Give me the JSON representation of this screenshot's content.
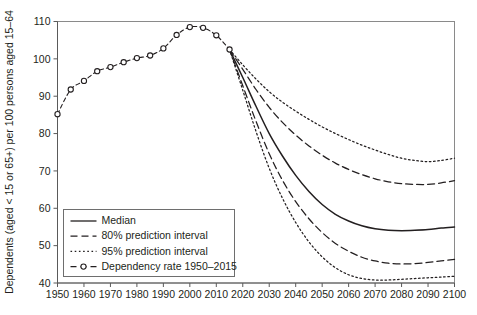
{
  "chart_data": {
    "type": "line",
    "title": "",
    "xlabel": "",
    "ylabel": "Dependents (aged < 15 or 65+) per 100 persons aged 15–64",
    "xlim": [
      1950,
      2100
    ],
    "ylim": [
      40,
      110
    ],
    "xticks": [
      1950,
      1960,
      1970,
      1980,
      1990,
      2000,
      2010,
      2020,
      2030,
      2040,
      2050,
      2060,
      2070,
      2080,
      2090,
      2100
    ],
    "yticks": [
      40,
      50,
      60,
      70,
      80,
      90,
      100,
      110
    ],
    "xtick_labels": [
      "1950",
      "1960",
      "1970",
      "1980",
      "1990",
      "2000",
      "2010",
      "2020",
      "2030",
      "2040",
      "2050",
      "2060",
      "2070",
      "2080",
      "2090",
      "2100"
    ],
    "ytick_labels": [
      "40",
      "50",
      "60",
      "70",
      "80",
      "90",
      "100",
      "110"
    ],
    "grid": false,
    "legend_position": "lower-left",
    "series": [
      {
        "name": "Median",
        "style": "solid",
        "color": "#231f20",
        "x": [
          2015,
          2020,
          2025,
          2030,
          2035,
          2040,
          2045,
          2050,
          2055,
          2060,
          2065,
          2070,
          2075,
          2080,
          2085,
          2090,
          2095,
          2100
        ],
        "values": [
          102.5,
          95.0,
          87.3,
          80.0,
          74.0,
          68.8,
          64.5,
          61.0,
          58.4,
          56.6,
          55.3,
          54.5,
          54.1,
          54.0,
          54.1,
          54.3,
          54.7,
          55.0
        ]
      },
      {
        "name": "80% prediction interval",
        "style": "dashed",
        "color": "#231f20",
        "bounds": {
          "upper": {
            "x": [
              2015,
              2020,
              2025,
              2030,
              2035,
              2040,
              2045,
              2050,
              2055,
              2060,
              2065,
              2070,
              2075,
              2080,
              2085,
              2090,
              2095,
              2100
            ],
            "values": [
              102.5,
              97.2,
              91.8,
              87.0,
              83.0,
              79.6,
              76.7,
              74.2,
              72.1,
              70.4,
              69.0,
              67.9,
              67.1,
              66.6,
              66.4,
              66.4,
              66.8,
              67.4
            ]
          },
          "lower": {
            "x": [
              2015,
              2020,
              2025,
              2030,
              2035,
              2040,
              2045,
              2050,
              2055,
              2060,
              2065,
              2070,
              2075,
              2080,
              2085,
              2090,
              2095,
              2100
            ],
            "values": [
              102.5,
              92.8,
              83.3,
              74.6,
              67.5,
              61.8,
              57.2,
              53.5,
              50.6,
              48.5,
              46.9,
              45.9,
              45.3,
              45.1,
              45.2,
              45.5,
              45.9,
              46.3
            ]
          }
        }
      },
      {
        "name": "95% prediction interval",
        "style": "dotted",
        "color": "#231f20",
        "bounds": {
          "upper": {
            "x": [
              2015,
              2020,
              2025,
              2030,
              2035,
              2040,
              2045,
              2050,
              2055,
              2060,
              2065,
              2070,
              2075,
              2080,
              2085,
              2090,
              2095,
              2100
            ],
            "values": [
              102.5,
              98.4,
              94.6,
              91.2,
              88.4,
              86.0,
              83.8,
              81.8,
              80.0,
              78.4,
              76.9,
              75.6,
              74.4,
              73.4,
              72.8,
              72.5,
              72.8,
              73.4
            ]
          },
          "lower": {
            "x": [
              2015,
              2020,
              2025,
              2030,
              2035,
              2040,
              2045,
              2050,
              2055,
              2060,
              2065,
              2070,
              2075,
              2080,
              2085,
              2090,
              2095,
              2100
            ],
            "values": [
              102.5,
              91.6,
              80.6,
              70.7,
              62.7,
              56.2,
              51.0,
              47.0,
              44.1,
              42.2,
              41.2,
              40.8,
              40.8,
              41.0,
              41.2,
              41.4,
              41.6,
              41.8
            ]
          }
        }
      },
      {
        "name": "Dependency rate 1950–2015",
        "style": "dashed-markers",
        "color": "#231f20",
        "marker": "open-circle",
        "x": [
          1950,
          1955,
          1960,
          1965,
          1970,
          1975,
          1980,
          1985,
          1990,
          1995,
          2000,
          2005,
          2010,
          2015
        ],
        "values": [
          85.2,
          91.8,
          94.1,
          96.7,
          97.8,
          99.1,
          100.2,
          100.9,
          102.8,
          106.4,
          108.5,
          108.3,
          106.3,
          102.5
        ]
      }
    ],
    "legend_entries": [
      {
        "label": "Median",
        "style": "solid"
      },
      {
        "label": "80% prediction interval",
        "style": "dashed"
      },
      {
        "label": "95% prediction interval",
        "style": "dotted"
      },
      {
        "label": "Dependency rate 1950–2015",
        "style": "dashed-markers"
      }
    ]
  }
}
